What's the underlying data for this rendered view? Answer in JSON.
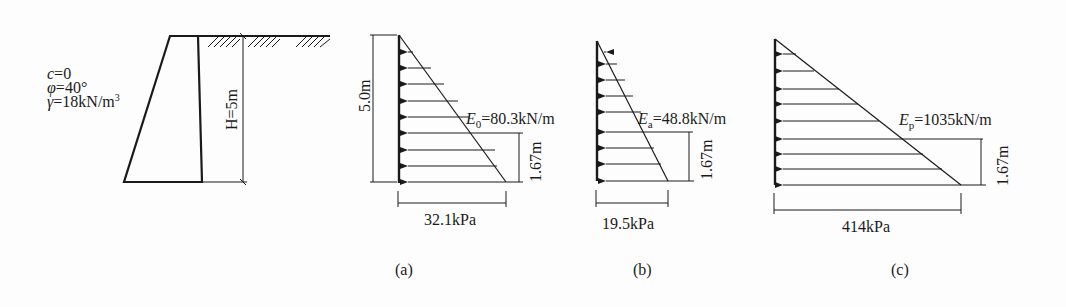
{
  "wall": {
    "params": [
      "c=0",
      "φ=40°",
      "γ=18kN/m³"
    ],
    "c_label": "c",
    "c_value": "=0",
    "phi_label": "φ",
    "phi_value": "=40°",
    "gamma_label": "γ",
    "gamma_value": "=18kN/m",
    "gamma_sup": "3",
    "height_label": "H=5m"
  },
  "diagram_a": {
    "caption": "(a)",
    "height_label": "5.0m",
    "force_symbol": "E",
    "force_sub": "0",
    "force_value": "=80.3kN/m",
    "arm_label": "1.67m",
    "base_label": "32.1kPa"
  },
  "diagram_b": {
    "caption": "(b)",
    "force_symbol": "E",
    "force_sub": "a",
    "force_value": "=48.8kN/m",
    "arm_label": "1.67m",
    "base_label": "19.5kPa"
  },
  "diagram_c": {
    "caption": "(c)",
    "force_symbol": "E",
    "force_sub": "p",
    "force_value": "=1035kN/m",
    "arm_label": "1.67m",
    "base_label": "414kPa"
  },
  "colors": {
    "line": "#1a1a1a",
    "background": "#fdfdfd"
  }
}
